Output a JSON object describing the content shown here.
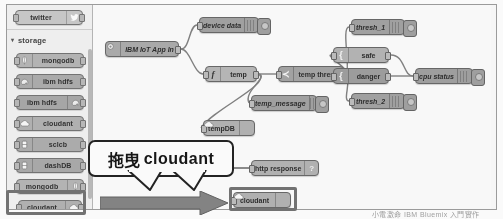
{
  "app": {
    "name": "Node-RED Flow Editor",
    "watermark": "小電激命 IBM Bluemix 入門實作"
  },
  "palette": {
    "scrollbar_name": "palette-scrollbar",
    "top_item": {
      "label": "twitter",
      "icon": "twitter-bird-icon",
      "color": "#c8c8c8"
    },
    "group": {
      "label": "storage",
      "chevron": "▾",
      "expanded": true
    },
    "items": [
      {
        "label": "mongodb",
        "icon": "leaf-icon",
        "icon_side": "left",
        "color": "#b4b4b4"
      },
      {
        "label": "ibm hdfs",
        "icon": "elephant-icon",
        "icon_side": "left",
        "color": "#aaaaaa"
      },
      {
        "label": "ibm hdfs",
        "icon": "elephant-icon",
        "icon_side": "right",
        "color": "#a6a6a6"
      },
      {
        "label": "cloudant",
        "icon": "cloud-icon",
        "icon_side": "left",
        "color": "#b0b0b0"
      },
      {
        "label": "sclcb",
        "icon": "database-icon",
        "icon_side": "left",
        "color": "#ababab"
      },
      {
        "label": "dashDB",
        "icon": "database-icon",
        "icon_side": "left",
        "color": "#a8a8a8"
      },
      {
        "label": "mongodb",
        "icon": "leaf-icon",
        "icon_side": "right",
        "color": "#b4b4b4"
      },
      {
        "label": "cloudant",
        "icon": "cloud-icon",
        "icon_side": "right",
        "color": "#b0b0b0"
      }
    ],
    "highlighted_item_index": 7
  },
  "callout": {
    "cn_text": "拖曳",
    "en_text": "cloudant",
    "meaning": "drag cloudant"
  },
  "flow": {
    "nodes": [
      {
        "id": "iot-in",
        "label": "IBM IoT App In",
        "icon": "gear-icon",
        "icon_side": "left",
        "x": 12,
        "y": 36,
        "w": 74,
        "type": "input",
        "has_lamp": false,
        "italic": true
      },
      {
        "id": "device-data",
        "label": "device data",
        "icon": "grip-icon",
        "icon_side": "right",
        "x": 106,
        "y": 12,
        "w": 60,
        "type": "debug",
        "has_lamp": true,
        "italic": true
      },
      {
        "id": "temp",
        "label": "temp",
        "icon": "function-icon",
        "icon_side": "left",
        "x": 112,
        "y": 61,
        "w": 52,
        "type": "function",
        "has_lamp": false,
        "italic": false
      },
      {
        "id": "temp-thresh",
        "label": "temp thresh",
        "icon": "switch-icon",
        "icon_side": "left",
        "x": 185,
        "y": 61,
        "w": 66,
        "type": "switch",
        "has_lamp": false,
        "italic": false
      },
      {
        "id": "temp-message",
        "label": "temp_message",
        "icon": "grip-icon",
        "icon_side": "right",
        "x": 158,
        "y": 90,
        "w": 66,
        "type": "debug",
        "has_lamp": true,
        "italic": true
      },
      {
        "id": "tempdb",
        "label": "tempDB",
        "icon": "cloud-icon",
        "icon_side": "right",
        "x": 110,
        "y": 115,
        "w": 52,
        "type": "storage",
        "has_lamp": false,
        "italic": false
      },
      {
        "id": "thresh-1",
        "label": "thresh_1",
        "icon": "grip-icon",
        "icon_side": "right",
        "x": 258,
        "y": 14,
        "w": 54,
        "type": "debug",
        "has_lamp": true,
        "italic": true
      },
      {
        "id": "safe",
        "label": "safe",
        "icon": "template-icon",
        "icon_side": "left",
        "x": 240,
        "y": 42,
        "w": 56,
        "type": "change",
        "has_lamp": false,
        "italic": false
      },
      {
        "id": "danger",
        "label": "danger",
        "icon": "template-icon",
        "icon_side": "left",
        "x": 240,
        "y": 63,
        "w": 56,
        "type": "change",
        "has_lamp": false,
        "italic": false
      },
      {
        "id": "thresh-2",
        "label": "thresh_2",
        "icon": "grip-icon",
        "icon_side": "right",
        "x": 258,
        "y": 88,
        "w": 54,
        "type": "debug",
        "has_lamp": true,
        "italic": true
      },
      {
        "id": "cpu-status",
        "label": "cpu status",
        "icon": "grip-icon",
        "icon_side": "right",
        "x": 322,
        "y": 63,
        "w": 58,
        "type": "debug",
        "has_lamp": true,
        "italic": true
      },
      {
        "id": "http-resp",
        "label": "http response",
        "icon": "question-icon",
        "icon_side": "right",
        "x": 158,
        "y": 155,
        "w": 68,
        "type": "http",
        "has_lamp": false,
        "italic": false
      },
      {
        "id": "cloudant-new",
        "label": "cloudant",
        "icon": "cloud-icon",
        "icon_side": "right",
        "x": 140,
        "y": 187,
        "w": 58,
        "type": "storage",
        "has_lamp": false,
        "italic": false
      }
    ],
    "dropped_node_highlight": "cloudant-new"
  }
}
